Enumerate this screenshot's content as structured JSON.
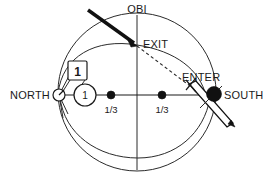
{
  "figure": {
    "labels": {
      "obi": "OBI",
      "exit": "EXIT",
      "enter": "ENTER",
      "north": "NORTH",
      "south": "SOUTH",
      "box_marker": "1",
      "circle_marker": "1",
      "fraction_left": "1/3",
      "fraction_right": "1/3"
    },
    "colors": {
      "line": "#2b2b2b",
      "bold_line": "#111111",
      "marker_fill": "#111111",
      "background": "#ffffff"
    },
    "markers": {
      "north_point": "open-circle",
      "south_point": "filled-circle",
      "third_left": "filled-dot",
      "third_right": "filled-dot"
    },
    "elements": {
      "outer_circle": "sphere-outline",
      "upper_arc": "upper-great-circle-arc",
      "lower_arc": "lower-great-circle-arc",
      "vertical_axis": "obi-vertical-axis",
      "horizontal_axis": "north-south-axis",
      "exit_arrow": "bold-incoming-arrow",
      "enter_arrow": "outlined-needle-arrow",
      "dashed_path": "exit-to-enter-dashed-path",
      "leader_line": "box-marker-leader-line"
    }
  }
}
